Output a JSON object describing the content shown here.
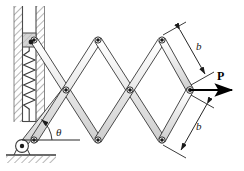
{
  "figure": {
    "type": "engineering-mechanics-diagram",
    "width": 244,
    "height": 171,
    "background_color": "#ffffff"
  },
  "labels": {
    "force": "P",
    "angle": "θ",
    "length_upper": "b",
    "length_lower": "b"
  },
  "colors": {
    "link_fill": "#e8e8e8",
    "link_stroke": "#2b2b2b",
    "link_highlight": "#f7f7f7",
    "joint_fill": "#1a1a1a",
    "joint_ring": "#ffffff",
    "hatch_stroke": "#7a7a7a",
    "wall_line": "#4a4a4a",
    "spring_stroke": "#3a3a3a",
    "dimension_stroke": "#1a1a1a",
    "force_arrow": "#000000",
    "slider_fill": "#d4d4d4",
    "ground_line": "#3a3a3a"
  },
  "geometry": {
    "link_half_width": 3.2,
    "joint_radius": 2.6,
    "top_row_y": 40,
    "mid_row_y": 90,
    "bottom_row_y": 140,
    "apex_x": 190,
    "nodes_top_x": [
      34,
      98,
      162
    ],
    "nodes_mid_x": [
      66,
      130
    ],
    "nodes_bottom_x": [
      34,
      98,
      162
    ],
    "slider_center": [
      34,
      40
    ],
    "pin_support": [
      22,
      146
    ],
    "angle_vertex": [
      22,
      146
    ],
    "angle_degrees": 52
  },
  "components": {
    "wall": "hatched-fixed-wall",
    "slot": "vertical-guide-slot",
    "slider": "slider-block",
    "spring": "coil-spring",
    "support": "pin-support-on-ground",
    "ground": "hatched-ground",
    "linkage": "scissor-lazy-tong",
    "force": "horizontal-applied-load"
  }
}
